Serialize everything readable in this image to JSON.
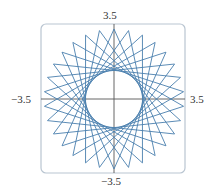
{
  "chart_data": {
    "type": "line",
    "title": "",
    "xlabel": "",
    "ylabel": "",
    "xlim": [
      -3.5,
      3.5
    ],
    "ylim": [
      -3.5,
      3.5
    ],
    "grid": false,
    "legend": null,
    "tick_labels": {
      "top": "3.5",
      "bottom": "−3.5",
      "left": "−3.5",
      "right": "3.5"
    },
    "series": [
      {
        "name": "star curve",
        "description": "closed star polygon curve, 30 outer tips at radius ~3.4, inner envelope circle radius ~1.4",
        "outer_radius": 3.4,
        "points_count": 30,
        "step": 11,
        "start_angle_deg": 90,
        "color": "#4a7fae"
      }
    ],
    "frame_color": "#b9c5d1",
    "axis_color": "#555555"
  }
}
